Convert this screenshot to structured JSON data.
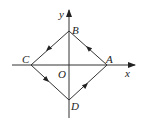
{
  "diagram": {
    "axes": {
      "x_label": "x",
      "y_label": "y",
      "origin_label": "O"
    },
    "points": [
      {
        "name": "A",
        "x": 107,
        "y": 65
      },
      {
        "name": "B",
        "x": 69,
        "y": 31
      },
      {
        "name": "C",
        "x": 31,
        "y": 65
      },
      {
        "name": "D",
        "x": 69,
        "y": 100
      }
    ],
    "path_direction": "A → B → C → D → A (counterclockwise)",
    "line_color": "#333333"
  }
}
